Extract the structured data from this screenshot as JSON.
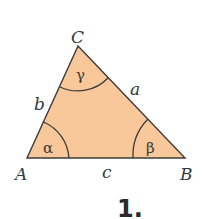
{
  "figure": {
    "number_label": "1.",
    "colors": {
      "fill": "#f8c89a",
      "stroke": "#3b3b3b",
      "background": "#ffffff"
    },
    "vertices": [
      {
        "name": "A",
        "x": 27,
        "y": 158
      },
      {
        "name": "B",
        "x": 185,
        "y": 158
      },
      {
        "name": "C",
        "x": 78,
        "y": 46
      }
    ],
    "sides": {
      "a": "a",
      "b": "b",
      "c": "c"
    },
    "angles": {
      "alpha": "α",
      "beta": "β",
      "gamma": "γ"
    }
  }
}
